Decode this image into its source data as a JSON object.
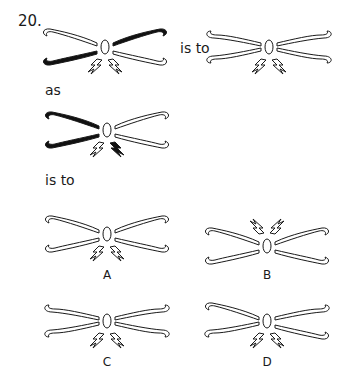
{
  "question": {
    "number": "20.",
    "phrase_is_to_1": "is to",
    "phrase_as": "as",
    "phrase_is_to_2": "is to"
  },
  "figures": {
    "stem_1": {
      "filled_arms": [
        "top-right",
        "bottom-left"
      ],
      "filled_bolts": [],
      "bolts": "below",
      "arm_style": "standard"
    },
    "stem_2": {
      "filled_arms": [],
      "filled_bolts": [],
      "bolts": "below",
      "arm_style": "mirrored"
    },
    "stem_3": {
      "filled_arms": [
        "top-left",
        "bottom-left"
      ],
      "filled_bolts": [
        "right"
      ],
      "bolts": "below",
      "arm_style": "standard"
    }
  },
  "options": [
    {
      "label": "A",
      "bolts": "below",
      "arm_style": "standard"
    },
    {
      "label": "B",
      "bolts": "above",
      "arm_style": "standard"
    },
    {
      "label": "C",
      "bolts": "below",
      "arm_style": "mirrored"
    },
    {
      "label": "D",
      "bolts": "below",
      "arm_style": "mirrored-alt"
    }
  ],
  "colors": {
    "stroke": "#1a1a1a",
    "fill_dark": "#111111",
    "background": "#ffffff"
  }
}
